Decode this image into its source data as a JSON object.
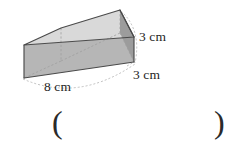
{
  "figure": {
    "name": "rectangular-prism",
    "shape": "cuboid",
    "projection": "oblique",
    "colors": {
      "top_face": "#d9d9d9",
      "front_face": "#b6b6b6",
      "right_face": "#9c9c9c",
      "edge": "#4a4a4a",
      "hidden_edge": "#9a9a9a",
      "background": "#ffffff",
      "text": "#1e1e1e"
    },
    "labels": {
      "height": "3 cm",
      "depth": "3 cm",
      "length": "8 cm"
    }
  },
  "answer": {
    "paren_open": "(",
    "paren_close": ")",
    "value": ""
  }
}
